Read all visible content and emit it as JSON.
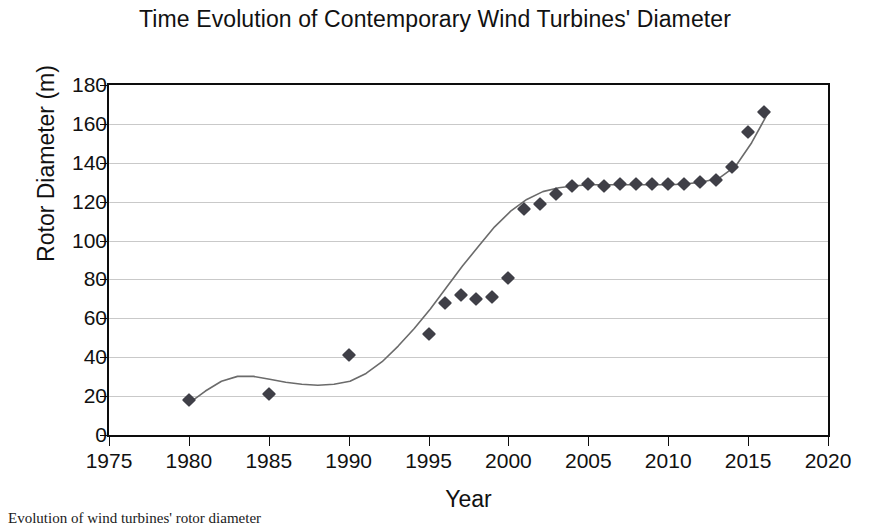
{
  "chart_data": {
    "type": "scatter",
    "title": "Time Evolution of Contemporary Wind Turbines' Diameter",
    "xlabel": "Year",
    "ylabel": "Rotor Diameter (m)",
    "xlim": [
      1975,
      2020
    ],
    "ylim": [
      0,
      180
    ],
    "xticks": [
      1975,
      1980,
      1985,
      1990,
      1995,
      2000,
      2005,
      2010,
      2015,
      2020
    ],
    "yticks": [
      0,
      20,
      40,
      60,
      80,
      100,
      120,
      140,
      160,
      180
    ],
    "grid": "horizontal",
    "legend": "none",
    "marker_style": "diamond",
    "marker_color": "#3f3f47",
    "trendline_color": "#6b6b6b",
    "series": [
      {
        "name": "Rotor Diameter",
        "points": [
          {
            "x": 1980,
            "y": 18
          },
          {
            "x": 1985,
            "y": 21
          },
          {
            "x": 1990,
            "y": 41
          },
          {
            "x": 1995,
            "y": 52
          },
          {
            "x": 1996,
            "y": 68
          },
          {
            "x": 1997,
            "y": 72
          },
          {
            "x": 1998,
            "y": 70
          },
          {
            "x": 1999,
            "y": 71
          },
          {
            "x": 2000,
            "y": 81
          },
          {
            "x": 2001,
            "y": 116
          },
          {
            "x": 2002,
            "y": 119
          },
          {
            "x": 2003,
            "y": 124
          },
          {
            "x": 2004,
            "y": 128
          },
          {
            "x": 2005,
            "y": 129
          },
          {
            "x": 2006,
            "y": 128
          },
          {
            "x": 2007,
            "y": 129
          },
          {
            "x": 2008,
            "y": 129
          },
          {
            "x": 2009,
            "y": 129
          },
          {
            "x": 2010,
            "y": 129
          },
          {
            "x": 2011,
            "y": 129
          },
          {
            "x": 2012,
            "y": 130
          },
          {
            "x": 2013,
            "y": 131
          },
          {
            "x": 2014,
            "y": 138
          },
          {
            "x": 2015,
            "y": 156
          },
          {
            "x": 2016,
            "y": 166
          }
        ]
      }
    ],
    "trendline": [
      {
        "x": 1980,
        "y": 18
      },
      {
        "x": 1981,
        "y": 24
      },
      {
        "x": 1982,
        "y": 29
      },
      {
        "x": 1983,
        "y": 31.5
      },
      {
        "x": 1984,
        "y": 31.5
      },
      {
        "x": 1985,
        "y": 30
      },
      {
        "x": 1986,
        "y": 28.5
      },
      {
        "x": 1987,
        "y": 27.5
      },
      {
        "x": 1988,
        "y": 27
      },
      {
        "x": 1989,
        "y": 27.5
      },
      {
        "x": 1990,
        "y": 29
      },
      {
        "x": 1991,
        "y": 33
      },
      {
        "x": 1992,
        "y": 39
      },
      {
        "x": 1993,
        "y": 47
      },
      {
        "x": 1994,
        "y": 56
      },
      {
        "x": 1995,
        "y": 66
      },
      {
        "x": 1996,
        "y": 77
      },
      {
        "x": 1997,
        "y": 88
      },
      {
        "x": 1998,
        "y": 98
      },
      {
        "x": 1999,
        "y": 108
      },
      {
        "x": 2000,
        "y": 116
      },
      {
        "x": 2001,
        "y": 122
      },
      {
        "x": 2002,
        "y": 126
      },
      {
        "x": 2003,
        "y": 128
      },
      {
        "x": 2004,
        "y": 129
      },
      {
        "x": 2005,
        "y": 129.5
      },
      {
        "x": 2006,
        "y": 129.5
      },
      {
        "x": 2007,
        "y": 129.5
      },
      {
        "x": 2008,
        "y": 129.5
      },
      {
        "x": 2009,
        "y": 129.5
      },
      {
        "x": 2010,
        "y": 129.5
      },
      {
        "x": 2011,
        "y": 130
      },
      {
        "x": 2012,
        "y": 131
      },
      {
        "x": 2013,
        "y": 133
      },
      {
        "x": 2014,
        "y": 139
      },
      {
        "x": 2015,
        "y": 151
      },
      {
        "x": 2016,
        "y": 166
      }
    ]
  },
  "caption": "Evolution of wind turbines' rotor diameter"
}
